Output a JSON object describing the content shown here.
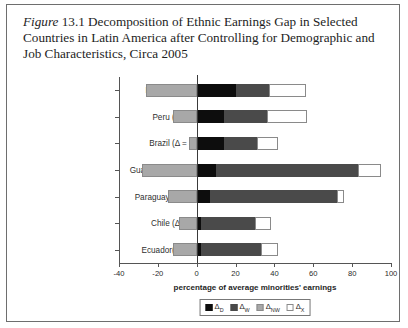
{
  "caption": {
    "figure_word": "Figure",
    "figure_number": "13.1",
    "text": " Decomposition of Ethnic Earnings Gap in Selected Countries in Latin America after Controlling for Demographic and Job Characteristics, Circa 2005"
  },
  "chart_data": {
    "type": "bar",
    "orientation": "horizontal",
    "stacked": true,
    "title": "Figure 13.1 Decomposition of Ethnic Earnings Gap in Selected Countries in Latin America after Controlling for Demographic and Job Characteristics, Circa 2005",
    "xlabel": "percentage of average minorities' earnings",
    "ylabel": "",
    "xlim": [
      -40,
      100
    ],
    "xticks": [
      -40,
      -20,
      0,
      20,
      40,
      60,
      80,
      100
    ],
    "xtick_labels": [
      "-40",
      "-20",
      "0",
      "20",
      "40",
      "60",
      "80",
      "100"
    ],
    "grid": false,
    "zero_reference_line": 0,
    "legend_position": "bottom",
    "categories": [
      "Bolivia (Δ = 30.6%)",
      "Peru (Δ = 45.5%)",
      "Brazil (Δ = 38.6%)",
      "Guatemala (Δ = 67.8%)",
      "Paraguay (Δ = 59.6%)",
      "Chile (Δ = 30.8%)",
      "Ecuador(Δ = 30.7%)"
    ],
    "country_names": [
      "Bolivia",
      "Peru",
      "Brazil",
      "Guatemala",
      "Paraguay",
      "Chile",
      "Ecuador"
    ],
    "total_gap_percent": [
      30.6,
      45.5,
      38.6,
      67.8,
      59.6,
      30.8,
      30.7
    ],
    "series": [
      {
        "name": "ΔD",
        "key": "delta_d",
        "color": "#0d0d0d",
        "values": [
          20,
          14,
          14,
          10,
          7,
          2,
          2
        ]
      },
      {
        "name": "ΔW",
        "key": "delta_w",
        "color": "#4a4a4a",
        "values": [
          17,
          22,
          17,
          73,
          65,
          28,
          31
        ]
      },
      {
        "name": "ΔNW",
        "key": "delta_nw",
        "color": "#a8a8a8",
        "values": [
          -26,
          -12,
          -4,
          -28,
          -15,
          -9,
          -12
        ]
      },
      {
        "name": "ΔX",
        "key": "delta_x",
        "color": "#ffffff",
        "values": [
          19,
          21,
          11,
          12,
          4,
          8,
          9
        ]
      }
    ]
  },
  "legend": {
    "items": [
      {
        "base": "Δ",
        "sub": "D",
        "swatch": "s-d"
      },
      {
        "base": "Δ",
        "sub": "W",
        "swatch": "s-w"
      },
      {
        "base": "Δ",
        "sub": "NW",
        "swatch": "s-nw"
      },
      {
        "base": "Δ",
        "sub": "X",
        "swatch": "s-x"
      }
    ]
  },
  "colors": {
    "delta_d": "#0d0d0d",
    "delta_w": "#4a4a4a",
    "delta_nw": "#a8a8a8",
    "delta_x": "#ffffff",
    "frame": "#6e6e6e",
    "axis": "#555555"
  }
}
